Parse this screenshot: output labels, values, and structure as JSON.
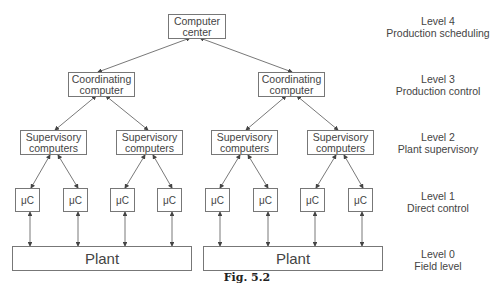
{
  "diagram": {
    "nodes": {
      "computer_center": "Computer center",
      "coord_left": "Coordinating computer",
      "coord_right": "Coordinating computer",
      "sup": [
        "Supervisory computers",
        "Supervisory computers",
        "Supervisory computers",
        "Supervisory computers"
      ],
      "uc": [
        "μC",
        "μC",
        "μC",
        "μC",
        "μC",
        "μC",
        "μC",
        "μC"
      ],
      "plant_left": "Plant",
      "plant_right": "Plant"
    },
    "levels": [
      {
        "level": "Level 4",
        "name": "Production scheduling"
      },
      {
        "level": "Level 3",
        "name": "Production control"
      },
      {
        "level": "Level 2",
        "name": "Plant supervisory"
      },
      {
        "level": "Level 1",
        "name": "Direct control"
      },
      {
        "level": "Level 0",
        "name": "Field level"
      }
    ],
    "caption": "Fig. 5.2"
  }
}
